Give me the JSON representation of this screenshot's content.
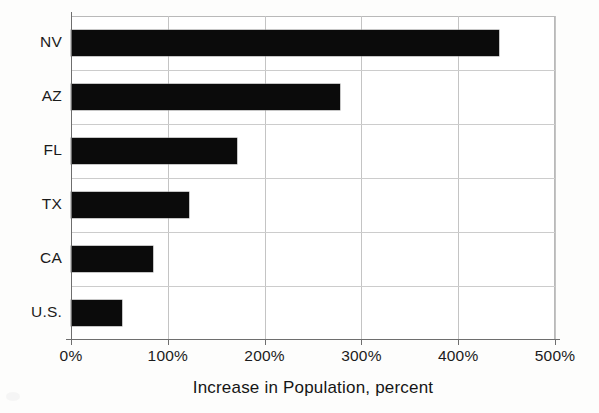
{
  "chart_data": {
    "type": "bar",
    "orientation": "horizontal",
    "title": "",
    "subtitle": "",
    "xlabel": "Increase in Population, percent",
    "ylabel": "",
    "categories": [
      "NV",
      "AZ",
      "FL",
      "TX",
      "CA",
      "U.S."
    ],
    "values": [
      442,
      278,
      171,
      122,
      85,
      53
    ],
    "value_unit": "percent",
    "xlim": [
      0,
      500
    ],
    "xticks": [
      0,
      100,
      200,
      300,
      400,
      500
    ],
    "xtick_labels": [
      "0%",
      "100%",
      "200%",
      "300%",
      "400%",
      "500%"
    ],
    "grid": {
      "vertical": true,
      "horizontal": true,
      "color": "#c4c4c4"
    },
    "legend": {
      "visible": false,
      "position": "none",
      "entries": []
    },
    "series": [
      {
        "name": "Increase in Population, percent",
        "color": "#0b0b0b",
        "values": [
          442,
          278,
          171,
          122,
          85,
          53
        ]
      }
    ],
    "annotations": []
  },
  "colors": {
    "bar": "#0b0b0b",
    "grid": "#c4c4c4",
    "axis": "#6e6e6e",
    "text": "#1b1b1b",
    "background": "#fdfdfc",
    "plot_background": "#ffffff"
  }
}
